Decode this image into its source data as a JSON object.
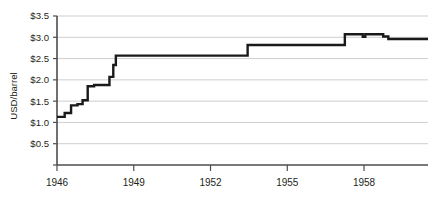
{
  "chart_data": {
    "type": "line",
    "title": "",
    "subtitle": "",
    "xlabel": "",
    "ylabel": "USD/barrel",
    "xlim": [
      1946.0,
      1960.5
    ],
    "ylim": [
      0.0,
      3.5
    ],
    "grid": true,
    "legend_position": "none",
    "x_ticks": [
      1946,
      1949,
      1952,
      1955,
      1958
    ],
    "x_tick_labels": [
      "1946",
      "1949",
      "1952",
      "1955",
      "1958"
    ],
    "y_ticks": [
      0.5,
      1.0,
      1.5,
      2.0,
      2.5,
      3.0,
      3.5
    ],
    "y_tick_labels": [
      "$0.5",
      "$1.0",
      "$1.5",
      "$2.0",
      "$2.5",
      "$3.0",
      "$3.5"
    ],
    "line_color": "#1a1a1a",
    "step_style": "post",
    "series": [
      {
        "name": "Crude oil posted price",
        "x": [
          1946.0,
          1946.3,
          1946.3,
          1946.55,
          1946.55,
          1946.8,
          1946.8,
          1947.0,
          1947.0,
          1947.2,
          1947.2,
          1947.45,
          1947.45,
          1948.05,
          1948.05,
          1948.2,
          1948.2,
          1948.3,
          1948.3,
          1953.45,
          1953.45,
          1957.25,
          1957.25,
          1957.95,
          1957.95,
          1958.05,
          1958.05,
          1958.75,
          1958.75,
          1958.95,
          1958.95,
          1960.5
        ],
        "y": [
          1.13,
          1.13,
          1.22,
          1.22,
          1.4,
          1.4,
          1.43,
          1.43,
          1.52,
          1.52,
          1.85,
          1.85,
          1.88,
          1.88,
          2.07,
          2.07,
          2.35,
          2.35,
          2.57,
          2.57,
          2.82,
          2.82,
          3.07,
          3.07,
          3.01,
          3.01,
          3.07,
          3.07,
          3.02,
          3.02,
          2.96,
          2.96
        ]
      }
    ],
    "annotations": []
  }
}
